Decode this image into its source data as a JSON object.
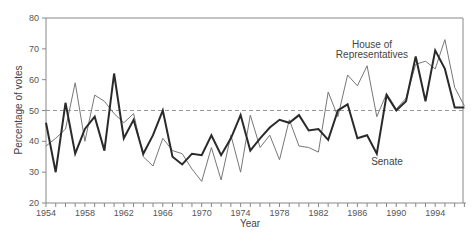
{
  "chart_data": {
    "type": "line",
    "title": "",
    "xlabel": "Year",
    "ylabel": "Percentage of votes",
    "ylim": [
      20,
      80
    ],
    "xlim": [
      1954,
      1997
    ],
    "grid": false,
    "reference_line": {
      "value": 50,
      "style": "dashed"
    },
    "y_ticks": [
      20,
      30,
      40,
      50,
      60,
      70,
      80
    ],
    "x_tick_labels": [
      1954,
      1958,
      1962,
      1966,
      1970,
      1974,
      1978,
      1982,
      1986,
      1990,
      1994
    ],
    "x": [
      1954,
      1955,
      1956,
      1957,
      1958,
      1959,
      1960,
      1961,
      1962,
      1963,
      1964,
      1965,
      1966,
      1967,
      1968,
      1969,
      1970,
      1971,
      1972,
      1973,
      1974,
      1975,
      1976,
      1977,
      1978,
      1979,
      1980,
      1981,
      1982,
      1983,
      1984,
      1985,
      1986,
      1987,
      1988,
      1989,
      1990,
      1991,
      1992,
      1993,
      1994,
      1995,
      1996,
      1997
    ],
    "series": [
      {
        "name": "House of Representatives",
        "style": "thin",
        "values": [
          38.5,
          41,
          44,
          59,
          40,
          55,
          53,
          49,
          46,
          49,
          35,
          32,
          41,
          37,
          36,
          31,
          27,
          38,
          27.5,
          42,
          30,
          48.5,
          38,
          42,
          34,
          47,
          38.5,
          38,
          36.5,
          56,
          48,
          61.5,
          58,
          64.5,
          48,
          55.5,
          50.5,
          54,
          65,
          66,
          63.5,
          73,
          57.5,
          51.5
        ]
      },
      {
        "name": "Senate",
        "style": "thick",
        "values": [
          46,
          30,
          52.5,
          36,
          44,
          48,
          37,
          62,
          41,
          47,
          36,
          42,
          50,
          35,
          32.5,
          36,
          35.5,
          42,
          35.5,
          41,
          48.5,
          37,
          41,
          44.5,
          47,
          46,
          48.5,
          43.5,
          44,
          40.5,
          50,
          52,
          41,
          42,
          36,
          55,
          50,
          53,
          67.5,
          53,
          69.5,
          63.5,
          51,
          51
        ]
      }
    ],
    "annotations": [
      {
        "text_line1": "House of",
        "text_line2": "Representatives",
        "near_series": "House of Representatives"
      },
      {
        "text": "Senate",
        "near_series": "Senate"
      }
    ],
    "legend": "inline labels"
  },
  "labels": {
    "house_line1": "House of",
    "house_line2": "Representatives",
    "senate": "Senate",
    "xlabel": "Year",
    "ylabel": "Percentage of votes"
  },
  "colors": {
    "house": "#777777",
    "senate": "#2a2a2a",
    "axis": "#888888",
    "reference": "#999999"
  }
}
